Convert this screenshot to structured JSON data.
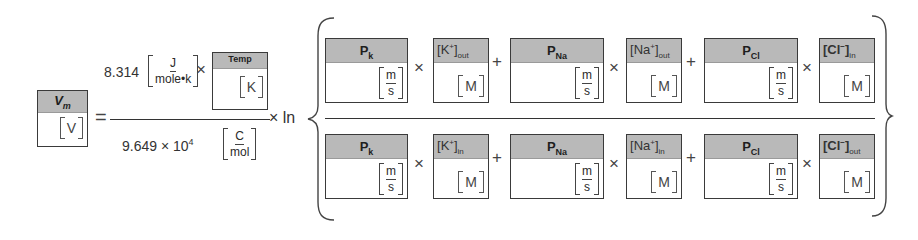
{
  "equation": {
    "name": "Goldman-Hodgkin-Katz voltage equation",
    "lhs": {
      "label": "V",
      "label_sub": "m",
      "unit": "V"
    },
    "equals": "=",
    "prefactor": {
      "numerator": {
        "constant": "8.314",
        "unit_num": "J",
        "unit_den": "mole•k",
        "times": "×",
        "temp_box": {
          "label": "Temp",
          "unit": "K"
        }
      },
      "denominator": {
        "constant": "9.649 × 10",
        "exponent": "4",
        "unit_num": "C",
        "unit_den": "mol"
      }
    },
    "times_ln": "× ln",
    "log_fraction": {
      "numerator": [
        {
          "type": "perm",
          "label": "P",
          "sub": "k",
          "unit_num": "m",
          "unit_den": "s"
        },
        {
          "op": "×"
        },
        {
          "type": "conc",
          "ion": "K",
          "charge": "+",
          "side": "out",
          "unit": "M"
        },
        {
          "op": "+"
        },
        {
          "type": "perm",
          "label": "P",
          "sub": "Na",
          "unit_num": "m",
          "unit_den": "s"
        },
        {
          "op": "×"
        },
        {
          "type": "conc",
          "ion": "Na",
          "charge": "+",
          "side": "out",
          "unit": "M"
        },
        {
          "op": "+"
        },
        {
          "type": "perm",
          "label": "P",
          "sub": "Cl",
          "unit_num": "m",
          "unit_den": "s"
        },
        {
          "op": "×"
        },
        {
          "type": "conc",
          "ion": "Cl",
          "charge": "−",
          "side": "in",
          "unit": "M"
        }
      ],
      "denominator": [
        {
          "type": "perm",
          "label": "P",
          "sub": "k",
          "unit_num": "m",
          "unit_den": "s"
        },
        {
          "op": "×"
        },
        {
          "type": "conc",
          "ion": "K",
          "charge": "+",
          "side": "in",
          "unit": "M"
        },
        {
          "op": "+"
        },
        {
          "type": "perm",
          "label": "P",
          "sub": "Na",
          "unit_num": "m",
          "unit_den": "s"
        },
        {
          "op": "×"
        },
        {
          "type": "conc",
          "ion": "Na",
          "charge": "+",
          "side": "in",
          "unit": "M"
        },
        {
          "op": "+"
        },
        {
          "type": "perm",
          "label": "P",
          "sub": "Cl",
          "unit_num": "m",
          "unit_den": "s"
        },
        {
          "op": "×"
        },
        {
          "type": "conc",
          "ion": "Cl",
          "charge": "−",
          "side": "out",
          "unit": "M"
        }
      ]
    }
  },
  "colors": {
    "header_fill": "#b9b9b9",
    "border": "#3a3a3a",
    "text": "#2a2a2a"
  }
}
